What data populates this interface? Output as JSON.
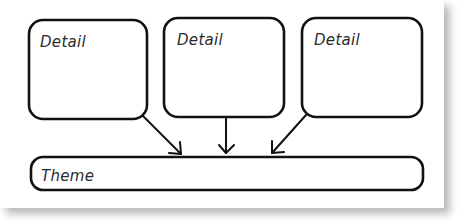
{
  "diagram": {
    "details": [
      {
        "label": "Detail"
      },
      {
        "label": "Detail"
      },
      {
        "label": "Detail"
      }
    ],
    "theme": {
      "label": "Theme"
    },
    "colors": {
      "stroke": "#111111",
      "background": "#ffffff",
      "shadow": "#c8c8c8"
    }
  }
}
